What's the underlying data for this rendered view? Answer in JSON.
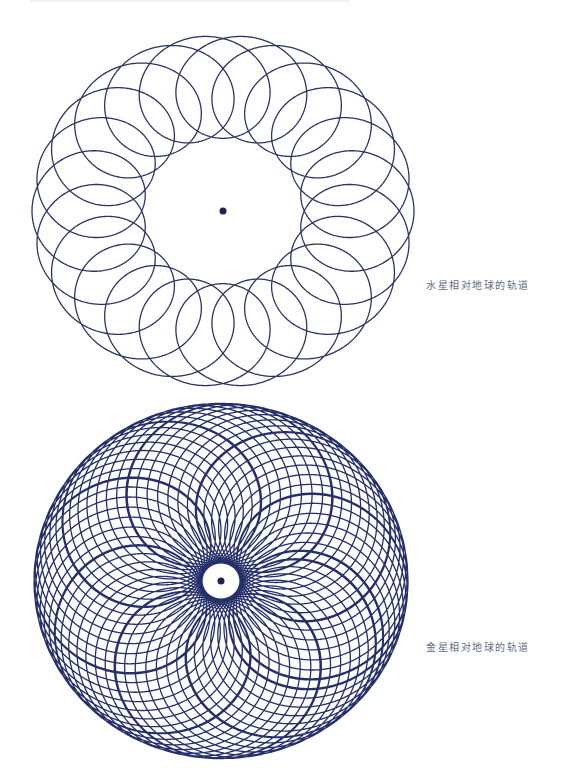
{
  "figures": [
    {
      "id": "mercury",
      "caption": "水星相对地球的轨道",
      "center": [
        223,
        211
      ],
      "caption_pos": [
        426,
        277
      ],
      "deferent": 135,
      "epicycle": 56,
      "loops": 22,
      "turns": 1,
      "drift": 0,
      "yscale": 0.92,
      "stroke": "#2b3563",
      "stroke_width": 1.3
    },
    {
      "id": "venus",
      "caption": "金星相对地球的轨道",
      "center": [
        221,
        581
      ],
      "caption_pos": [
        426,
        639
      ],
      "deferent": 103,
      "epicycle": 84,
      "loops": 8,
      "turns": 8,
      "drift": 0.0185,
      "yscale": 0.95,
      "stroke": "#25306a",
      "stroke_width": 1.3
    }
  ],
  "center_dot": {
    "color": "#1c2350",
    "radius": 3.5
  }
}
